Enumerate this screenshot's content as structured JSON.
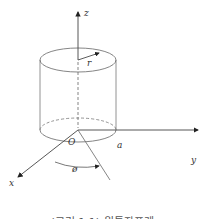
{
  "figure": {
    "labels": {
      "z_axis": "z",
      "x_axis": "x",
      "y_axis": "y",
      "origin": "O",
      "radius": "r",
      "radius_point": "a",
      "angle": "ø"
    },
    "caption": "(그림 1.1) 원통좌표계",
    "colors": {
      "stroke": "#555555",
      "text": "#333333",
      "background": "#ffffff"
    }
  }
}
